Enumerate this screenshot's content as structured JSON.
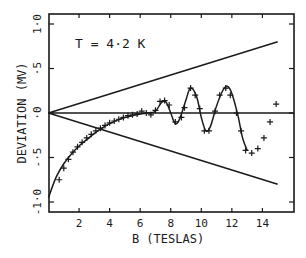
{
  "chart_data": {
    "type": "scatter",
    "title": "",
    "xlabel": "B (TESLAS)",
    "ylabel": "DEVIATION (MV)",
    "annotation": "T = 4·2 K",
    "xlim": [
      0,
      16.1
    ],
    "ylim": [
      -1.1,
      1.1
    ],
    "grid": false,
    "legend": null,
    "x_ticks": [
      2,
      4,
      6,
      8,
      10,
      12,
      14
    ],
    "x_tick_labels": [
      "2",
      "4",
      "6",
      "8",
      "10",
      "12",
      "14"
    ],
    "y_ticks": [
      1.0,
      0.5,
      0.0,
      -0.5,
      -1.0
    ],
    "y_tick_labels": [
      "1·0",
      "·5",
      "·0",
      "-·5",
      "-1·0"
    ],
    "series": [
      {
        "name": "measured",
        "kind": "markers",
        "marker": "+",
        "points": [
          [
            0.7,
            -0.75
          ],
          [
            1.0,
            -0.62
          ],
          [
            1.3,
            -0.52
          ],
          [
            1.6,
            -0.44
          ],
          [
            1.9,
            -0.38
          ],
          [
            2.2,
            -0.33
          ],
          [
            2.5,
            -0.28
          ],
          [
            2.8,
            -0.24
          ],
          [
            3.1,
            -0.2
          ],
          [
            3.4,
            -0.17
          ],
          [
            3.7,
            -0.14
          ],
          [
            4.0,
            -0.11
          ],
          [
            4.3,
            -0.09
          ],
          [
            4.6,
            -0.07
          ],
          [
            4.9,
            -0.05
          ],
          [
            5.2,
            -0.03
          ],
          [
            5.5,
            -0.02
          ],
          [
            5.8,
            -0.01
          ],
          [
            6.1,
            0.02
          ],
          [
            6.4,
            0.0
          ],
          [
            6.7,
            -0.02
          ],
          [
            7.0,
            0.03
          ],
          [
            7.3,
            0.13
          ],
          [
            7.6,
            0.14
          ],
          [
            7.9,
            0.09
          ],
          [
            8.3,
            -0.1
          ],
          [
            8.7,
            -0.05
          ],
          [
            8.9,
            0.06
          ],
          [
            9.3,
            0.28
          ],
          [
            9.6,
            0.2
          ],
          [
            9.9,
            0.05
          ],
          [
            10.2,
            -0.2
          ],
          [
            10.5,
            -0.2
          ],
          [
            10.9,
            0.02
          ],
          [
            11.2,
            0.2
          ],
          [
            11.6,
            0.28
          ],
          [
            11.9,
            0.2
          ],
          [
            12.3,
            0.0
          ],
          [
            12.6,
            -0.2
          ],
          [
            12.9,
            -0.42
          ],
          [
            13.3,
            -0.45
          ],
          [
            13.7,
            -0.4
          ],
          [
            14.1,
            -0.28
          ],
          [
            14.5,
            -0.1
          ],
          [
            14.9,
            0.1
          ]
        ]
      },
      {
        "name": "fit",
        "kind": "smooth-line",
        "points": [
          [
            0.0,
            -0.95
          ],
          [
            0.5,
            -0.72
          ],
          [
            1.0,
            -0.57
          ],
          [
            1.5,
            -0.46
          ],
          [
            2.0,
            -0.37
          ],
          [
            2.5,
            -0.3
          ],
          [
            3.0,
            -0.23
          ],
          [
            3.5,
            -0.17
          ],
          [
            4.0,
            -0.12
          ],
          [
            4.5,
            -0.08
          ],
          [
            5.0,
            -0.05
          ],
          [
            5.5,
            -0.03
          ],
          [
            6.0,
            -0.01
          ],
          [
            6.5,
            0.0
          ],
          [
            7.0,
            0.02
          ],
          [
            7.4,
            0.12
          ],
          [
            7.7,
            0.12
          ],
          [
            8.0,
            0.0
          ],
          [
            8.3,
            -0.12
          ],
          [
            8.6,
            -0.06
          ],
          [
            9.0,
            0.15
          ],
          [
            9.3,
            0.28
          ],
          [
            9.7,
            0.18
          ],
          [
            10.0,
            -0.05
          ],
          [
            10.3,
            -0.2
          ],
          [
            10.6,
            -0.15
          ],
          [
            11.0,
            0.08
          ],
          [
            11.4,
            0.25
          ],
          [
            11.7,
            0.3
          ],
          [
            12.0,
            0.22
          ],
          [
            12.4,
            -0.03
          ],
          [
            12.7,
            -0.28
          ],
          [
            13.0,
            -0.42
          ]
        ]
      },
      {
        "name": "upper-envelope",
        "kind": "line",
        "points": [
          [
            0.0,
            0.0
          ],
          [
            15.0,
            0.8
          ]
        ]
      },
      {
        "name": "lower-envelope",
        "kind": "line",
        "points": [
          [
            0.0,
            0.0
          ],
          [
            15.0,
            -0.8
          ]
        ]
      },
      {
        "name": "zero-line",
        "kind": "line",
        "points": [
          [
            0.0,
            0.0
          ],
          [
            16.1,
            0.0
          ]
        ]
      }
    ]
  },
  "colors": {
    "ink": "#1a1a1a",
    "background": "#ffffff"
  }
}
